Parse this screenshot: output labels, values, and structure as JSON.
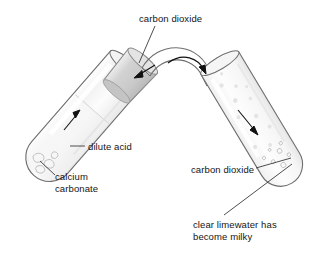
{
  "diagram": {
    "background_color": "#ffffff",
    "stroke_color": "#4d4d4d",
    "text_color": "#141414",
    "glass_fill": "#fbfbfb",
    "stopper_color": "#d8d8d8",
    "labels": {
      "co2_top": "carbon dioxide",
      "dilute_acid": "dilute acid",
      "calcium_carbonate": "calcium\ncarbonate",
      "co2_right": "carbon dioxide",
      "limewater": "clear limewater has\nbecome milky"
    },
    "apparatus": {
      "left_tube_name": "reaction test tube",
      "left_tube_contents": "dilute acid with calcium carbonate chips",
      "stopper_name": "rubber stopper",
      "delivery_tube_name": "curved delivery tube",
      "right_tube_name": "limewater test tube",
      "right_tube_contents": "clear limewater turning milky"
    },
    "arrows": {
      "left_tube_flow": "gas rising in reaction tube",
      "delivery_in": "gas entering delivery tube",
      "delivery_out": "gas leaving delivery tube",
      "right_tube_flow": "gas travelling down into limewater"
    }
  }
}
